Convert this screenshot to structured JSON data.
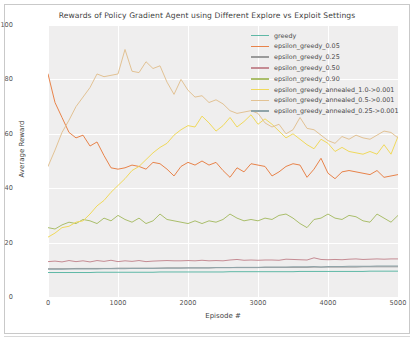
{
  "chart_data": {
    "type": "line",
    "title": "Rewards of Policy Gradient Agent using Different Explore vs Exploit Settings",
    "xlabel": "Episode #",
    "ylabel": "Average Reward",
    "xlim": [
      0,
      5000
    ],
    "ylim": [
      0,
      100
    ],
    "xticks": [
      "0",
      "1000",
      "2000",
      "3000",
      "4000",
      "5000"
    ],
    "xtick_values": [
      0,
      1000,
      2000,
      3000,
      4000,
      5000
    ],
    "yticks": [
      "0",
      "20",
      "40",
      "60",
      "80",
      "100"
    ],
    "ytick_values": [
      0,
      20,
      40,
      60,
      80,
      100
    ],
    "grid": true,
    "grid_color": "#ffffff",
    "plot_background": "#efeeee",
    "legend_position": "upper right",
    "x": [
      0,
      100,
      200,
      300,
      400,
      500,
      600,
      700,
      800,
      900,
      1000,
      1100,
      1200,
      1300,
      1400,
      1500,
      1600,
      1700,
      1800,
      1900,
      2000,
      2100,
      2200,
      2300,
      2400,
      2500,
      2600,
      2700,
      2800,
      2900,
      3000,
      3100,
      3200,
      3300,
      3400,
      3500,
      3600,
      3700,
      3800,
      3900,
      4000,
      4100,
      4200,
      4300,
      4400,
      4500,
      4600,
      4700,
      4800,
      4900,
      5000
    ],
    "series": [
      {
        "name": "greedy",
        "color": "#5fb8a6",
        "values": [
          9.0,
          9.0,
          9.0,
          9.0,
          9.0,
          9.0,
          9.0,
          9.1,
          9.1,
          9.1,
          9.1,
          9.1,
          9.1,
          9.1,
          9.1,
          9.1,
          9.2,
          9.2,
          9.2,
          9.2,
          9.2,
          9.2,
          9.2,
          9.2,
          9.2,
          9.2,
          9.3,
          9.3,
          9.3,
          9.3,
          9.3,
          9.3,
          9.3,
          9.3,
          9.3,
          9.3,
          9.4,
          9.4,
          9.4,
          9.4,
          9.4,
          9.4,
          9.4,
          9.4,
          9.4,
          9.4,
          9.5,
          9.5,
          9.5,
          9.5,
          9.5
        ]
      },
      {
        "name": "epsilon_greedy_0.05",
        "color": "#e8834a",
        "values": [
          82.0,
          71.5,
          66.0,
          60.5,
          58.5,
          59.5,
          55.5,
          57.0,
          52.0,
          47.5,
          47.0,
          47.5,
          48.5,
          48.0,
          47.0,
          49.5,
          49.0,
          47.0,
          44.5,
          48.0,
          49.5,
          48.5,
          50.0,
          48.5,
          49.5,
          46.5,
          44.0,
          47.5,
          46.0,
          49.0,
          48.5,
          48.0,
          44.5,
          46.0,
          48.0,
          49.0,
          48.5,
          44.0,
          47.0,
          51.0,
          45.5,
          43.5,
          46.0,
          46.5,
          46.0,
          45.5,
          45.0,
          46.5,
          44.0,
          44.5,
          45.0
        ]
      },
      {
        "name": "epsilon_greedy_0.25",
        "color": "#9a9a9a",
        "values": [
          10.4,
          10.4,
          10.4,
          10.4,
          10.5,
          10.5,
          10.5,
          10.5,
          10.5,
          10.5,
          10.6,
          10.6,
          10.6,
          10.6,
          10.6,
          10.6,
          10.6,
          10.7,
          10.7,
          10.7,
          10.7,
          10.7,
          10.7,
          10.7,
          10.8,
          10.8,
          10.8,
          10.8,
          10.8,
          10.8,
          10.8,
          10.9,
          10.9,
          10.9,
          10.9,
          10.9,
          10.9,
          10.9,
          11.0,
          11.0,
          11.0,
          11.0,
          11.0,
          11.0,
          11.0,
          11.1,
          11.1,
          11.1,
          11.1,
          11.1,
          11.1
        ]
      },
      {
        "name": "epsilon_greedy_0.50",
        "color": "#c58b93",
        "values": [
          13.0,
          13.2,
          12.9,
          13.4,
          13.0,
          13.3,
          12.9,
          13.4,
          13.1,
          13.5,
          13.0,
          13.3,
          13.1,
          13.4,
          13.0,
          13.2,
          13.3,
          13.4,
          13.3,
          13.3,
          13.4,
          13.3,
          13.5,
          13.3,
          13.4,
          13.3,
          13.6,
          13.8,
          13.5,
          13.6,
          13.5,
          13.6,
          13.6,
          13.5,
          13.9,
          13.8,
          13.7,
          13.6,
          14.4,
          13.8,
          13.7,
          13.8,
          13.7,
          13.9,
          14.0,
          13.8,
          13.9,
          14.0,
          13.9,
          14.0,
          14.0
        ]
      },
      {
        "name": "epsilon_greedy_0.90",
        "color": "#aabe6b",
        "values": [
          25.5,
          25.0,
          26.5,
          27.5,
          27.0,
          28.5,
          28.0,
          27.0,
          29.0,
          28.0,
          30.0,
          28.5,
          27.5,
          29.0,
          27.0,
          28.0,
          30.5,
          28.5,
          28.0,
          27.5,
          27.0,
          28.0,
          27.0,
          28.0,
          27.5,
          28.5,
          30.5,
          29.0,
          28.0,
          28.5,
          28.0,
          29.0,
          28.5,
          30.0,
          30.5,
          29.0,
          27.0,
          25.5,
          28.5,
          29.0,
          30.5,
          29.0,
          28.5,
          30.0,
          29.5,
          28.0,
          27.5,
          30.5,
          29.0,
          27.5,
          30.0
        ]
      },
      {
        "name": "epsilon_greedy_annealed_1.0->0.001",
        "color": "#f0d95c",
        "values": [
          22.0,
          23.5,
          25.5,
          26.0,
          27.5,
          28.0,
          30.5,
          33.5,
          35.5,
          38.5,
          41.0,
          43.5,
          46.5,
          48.0,
          50.5,
          53.0,
          55.0,
          56.5,
          59.5,
          61.5,
          63.0,
          62.5,
          66.5,
          64.0,
          61.0,
          63.0,
          66.0,
          62.5,
          64.5,
          67.0,
          63.5,
          65.5,
          63.5,
          61.0,
          58.5,
          60.0,
          58.0,
          56.0,
          54.5,
          58.0,
          56.5,
          53.5,
          55.0,
          53.5,
          53.0,
          52.5,
          53.5,
          52.5,
          56.0,
          52.5,
          59.0
        ]
      },
      {
        "name": "epsilon_greedy_annealed_0.5->0.001",
        "color": "#e2c294",
        "values": [
          48.0,
          54.0,
          60.5,
          65.0,
          70.0,
          73.5,
          77.0,
          82.0,
          81.0,
          81.5,
          82.0,
          91.0,
          83.0,
          82.5,
          86.5,
          84.0,
          85.0,
          79.0,
          74.5,
          80.0,
          76.0,
          73.5,
          74.0,
          71.5,
          72.5,
          71.0,
          68.5,
          67.5,
          68.0,
          68.5,
          67.5,
          64.0,
          62.5,
          63.5,
          60.0,
          61.5,
          66.0,
          62.0,
          61.5,
          59.5,
          57.5,
          56.5,
          59.0,
          58.0,
          59.5,
          58.5,
          58.0,
          59.5,
          61.0,
          60.5,
          58.5
        ]
      },
      {
        "name": "epsilon_greedy_annealed_0.25->0.001",
        "color": "#8fa3a8",
        "values": [
          10.2,
          10.2,
          10.2,
          10.3,
          10.3,
          10.3,
          10.3,
          10.3,
          10.4,
          10.4,
          10.4,
          10.4,
          10.5,
          10.5,
          10.5,
          10.5,
          10.6,
          10.6,
          10.6,
          10.6,
          10.7,
          10.7,
          10.7,
          10.7,
          10.8,
          10.8,
          10.8,
          10.9,
          10.9,
          10.9,
          10.9,
          11.0,
          11.0,
          11.0,
          11.0,
          11.1,
          11.1,
          11.1,
          11.2,
          11.0,
          11.2,
          11.2,
          11.2,
          11.3,
          11.3,
          11.3,
          11.3,
          11.4,
          11.4,
          11.4,
          11.4
        ]
      }
    ]
  }
}
